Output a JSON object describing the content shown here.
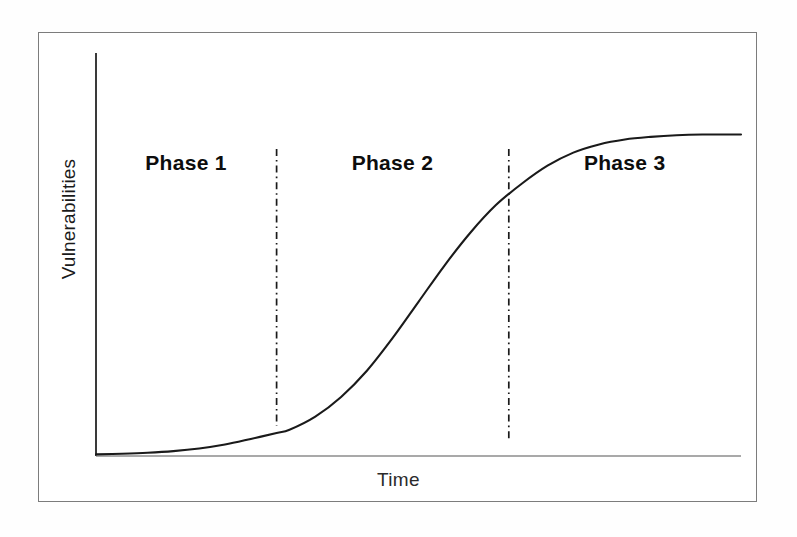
{
  "figure": {
    "border_color": "#7c7c7c",
    "background": "#ffffff"
  },
  "axes": {
    "y_title": "Vulnerabilities",
    "x_title": "Time",
    "y_axis_color": "#3a3a3a",
    "x_axis_color": "#8c8c8c"
  },
  "annotations": {
    "phases": [
      {
        "label": "Phase 1"
      },
      {
        "label": "Phase 2"
      },
      {
        "label": "Phase 3"
      }
    ],
    "divider_color": "#1a1a1a",
    "divider_style": "dash-dot"
  },
  "chart_data": {
    "type": "line",
    "title": "",
    "subtitle": "",
    "xlabel": "Time",
    "ylabel": "Vulnerabilities",
    "xlim": [
      0,
      100
    ],
    "ylim": [
      0,
      100
    ],
    "grid": false,
    "legend": null,
    "axis_ticks": {
      "x": [],
      "y": []
    },
    "curve_color": "#1a1a1a",
    "curve_width": 2,
    "series": [
      {
        "name": "Cumulative vulnerabilities",
        "x": [
          0,
          4,
          8,
          12,
          16,
          20,
          24,
          28,
          30,
          34,
          38,
          42,
          46,
          50,
          54,
          58,
          62,
          66,
          70,
          74,
          78,
          82,
          86,
          90,
          94,
          100
        ],
        "y": [
          0.5,
          0.7,
          1.0,
          1.5,
          2.3,
          3.5,
          5.2,
          7.0,
          8.0,
          12.0,
          18.0,
          26.0,
          36.0,
          47.0,
          58.0,
          68.0,
          76.5,
          83.0,
          88.5,
          92.5,
          95.0,
          96.5,
          97.3,
          97.8,
          98.0,
          98.0
        ]
      }
    ],
    "phase_dividers": [
      {
        "label": "Phase 1 / Phase 2 boundary",
        "x": 28,
        "y_at_x": 7.0
      },
      {
        "label": "Phase 2 / Phase 3 boundary",
        "x": 64,
        "y_at_x": 80.0
      }
    ],
    "phase_regions": [
      {
        "label": "Phase 1",
        "x_start": 0,
        "x_end": 28,
        "shape": "slow initial growth"
      },
      {
        "label": "Phase 2",
        "x_start": 28,
        "x_end": 64,
        "shape": "rapid exponential rise"
      },
      {
        "label": "Phase 3",
        "x_start": 64,
        "x_end": 100,
        "shape": "saturation plateau"
      }
    ]
  }
}
